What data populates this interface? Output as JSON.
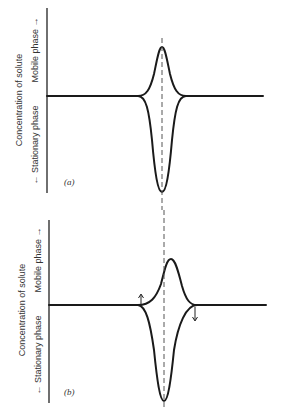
{
  "panels": [
    {
      "id": "a",
      "label": "(a)",
      "y_axis_title": "Concentration of solute",
      "upper_label": "Mobile phase →",
      "lower_label": "← Stationary phase",
      "description": "Symmetric solute peak in mobile phase mirrored by trough in stationary phase, aligned on dashed center line"
    },
    {
      "id": "b",
      "label": "(b)",
      "y_axis_title": "Concentration of solute",
      "upper_label": "Mobile phase →",
      "lower_label": "← Stationary phase",
      "description": "Mobile-phase peak shifted right of stationary-phase trough; arrows indicate transfer directions at leading and trailing edges"
    }
  ],
  "colors": {
    "ink": "#1a1a1a",
    "background": "#ffffff"
  }
}
